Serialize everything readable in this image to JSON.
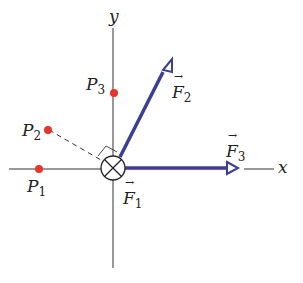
{
  "diagram": {
    "axes": {
      "x_label": "x",
      "y_label": "y",
      "axis_color": "#333333"
    },
    "origin_symbol": "current-into-page",
    "points": [
      {
        "name": "P",
        "sub": "1",
        "color": "#e8352a"
      },
      {
        "name": "P",
        "sub": "2",
        "color": "#e8352a"
      },
      {
        "name": "P",
        "sub": "3",
        "color": "#e8352a"
      }
    ],
    "forces": [
      {
        "name": "F",
        "sub": "1"
      },
      {
        "name": "F",
        "sub": "2",
        "color": "#3b3f94"
      },
      {
        "name": "F",
        "sub": "3",
        "color": "#3b3f94"
      }
    ],
    "vector_arrow": "→"
  }
}
